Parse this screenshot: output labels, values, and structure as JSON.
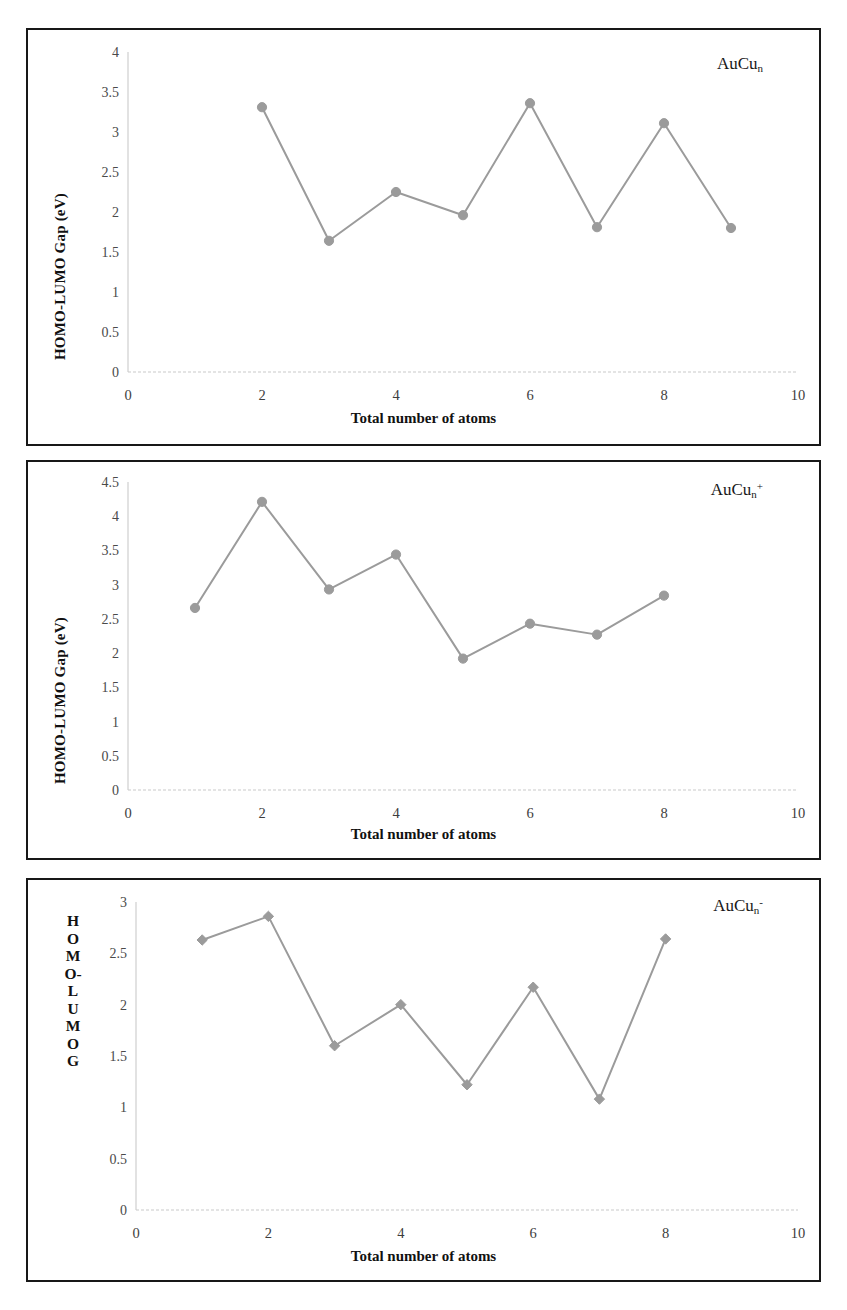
{
  "figure": {
    "axis_title_x": "Total number of atoms",
    "axis_title_y": "HOMO-LUMO Gap (eV)",
    "series_color": "#9b9b9b",
    "frame_color": "#181818"
  },
  "panel1": {
    "series_label_base": "AuCu",
    "series_label_sub": "n",
    "series_label_sup": "",
    "ylabel": "HOMO-LUMO Gap (eV)",
    "xlabel": "Total number of atoms"
  },
  "panel2": {
    "series_label_base": "AuCu",
    "series_label_sub": "n",
    "series_label_sup": "+",
    "ylabel": "HOMO-LUMO Gap (eV)",
    "xlabel": "Total number of atoms"
  },
  "panel3": {
    "series_label_base": "AuCu",
    "series_label_sub": "n",
    "series_label_sup": "-",
    "ylabel_letters": [
      "H",
      "O",
      "M",
      "O-",
      "L",
      "U",
      "M",
      "O",
      "G"
    ],
    "xlabel": "Total number of atoms"
  },
  "chart_data": [
    {
      "type": "line",
      "title": "AuCu_n",
      "xlabel": "Total number of atoms",
      "ylabel": "HOMO-LUMO Gap (eV)",
      "x": [
        2,
        3,
        4,
        5,
        6,
        7,
        8,
        9
      ],
      "values": [
        3.31,
        1.64,
        2.25,
        1.96,
        3.36,
        1.81,
        3.11,
        1.8
      ],
      "xlim": [
        0,
        10
      ],
      "ylim": [
        0,
        4
      ],
      "xticks": [
        "0",
        "2",
        "4",
        "6",
        "8",
        "10"
      ],
      "yticks": [
        "0",
        "0.5",
        "1",
        "1.5",
        "2",
        "2.5",
        "3",
        "3.5",
        "4"
      ],
      "marker": "circle",
      "color": "#9b9b9b",
      "grid": false,
      "legend": "none"
    },
    {
      "type": "line",
      "title": "AuCu_n+",
      "xlabel": "Total number of atoms",
      "ylabel": "HOMO-LUMO Gap (eV)",
      "x": [
        1,
        2,
        3,
        4,
        5,
        6,
        7,
        8
      ],
      "values": [
        2.66,
        4.21,
        2.93,
        3.44,
        1.92,
        2.43,
        2.27,
        2.84
      ],
      "xlim": [
        0,
        10
      ],
      "ylim": [
        0,
        4.5
      ],
      "xticks": [
        "0",
        "2",
        "4",
        "6",
        "8",
        "10"
      ],
      "yticks": [
        "0",
        "0.5",
        "1",
        "1.5",
        "2",
        "2.5",
        "3",
        "3.5",
        "4",
        "4.5"
      ],
      "marker": "circle",
      "color": "#9b9b9b",
      "grid": false,
      "legend": "none"
    },
    {
      "type": "line",
      "title": "AuCu_n-",
      "xlabel": "Total number of atoms",
      "ylabel": "HOMO-LUMO G",
      "x": [
        1,
        2,
        3,
        4,
        5,
        6,
        7,
        8
      ],
      "values": [
        2.63,
        2.86,
        1.6,
        2.0,
        1.22,
        2.17,
        1.08,
        2.64
      ],
      "xlim": [
        0,
        10
      ],
      "ylim": [
        0,
        3
      ],
      "xticks": [
        "0",
        "2",
        "4",
        "6",
        "8",
        "10"
      ],
      "yticks": [
        "0",
        "0.5",
        "1",
        "1.5",
        "2",
        "2.5",
        "3"
      ],
      "marker": "diamond",
      "color": "#9b9b9b",
      "grid": false,
      "legend": "none"
    }
  ]
}
